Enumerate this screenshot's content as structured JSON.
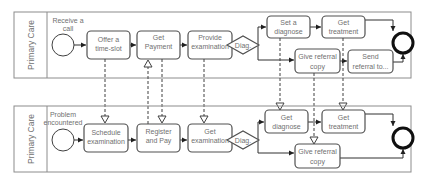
{
  "diagram": {
    "type": "bpmn-collaboration",
    "pools": [
      {
        "id": "top",
        "label": "Primary Care",
        "start_event": {
          "label_line1": "Receive a",
          "label_line2": "call"
        },
        "tasks": [
          {
            "id": "offer",
            "line1": "Offer a",
            "line2": "time-slot"
          },
          {
            "id": "payment",
            "line1": "Get",
            "line2": "Payment"
          },
          {
            "id": "provide",
            "line1": "Provide",
            "line2": "examination"
          },
          {
            "id": "setdiag",
            "line1": "Set a",
            "line2": "diagnose"
          },
          {
            "id": "treat",
            "line1": "Get",
            "line2": "treatment"
          },
          {
            "id": "referral",
            "line1": "Give referral",
            "line2": "copy"
          },
          {
            "id": "send",
            "line1": "Send",
            "line2": "referral to..."
          }
        ],
        "gateway": {
          "label": "Diag."
        }
      },
      {
        "id": "bottom",
        "label": "Primary Care",
        "start_event": {
          "label_line1": "Problem",
          "label_line2": "encountered"
        },
        "tasks": [
          {
            "id": "schedule",
            "line1": "Schedule",
            "line2": "examination"
          },
          {
            "id": "register",
            "line1": "Register",
            "line2": "and Pay"
          },
          {
            "id": "getexam",
            "line1": "Get",
            "line2": "examination"
          },
          {
            "id": "getdiag",
            "line1": "Get",
            "line2": "diagnose"
          },
          {
            "id": "gettreat",
            "line1": "Get",
            "line2": "treatment"
          },
          {
            "id": "getref",
            "line1": "Give referral",
            "line2": "copy"
          }
        ],
        "gateway": {
          "label": "Diag."
        }
      }
    ]
  }
}
